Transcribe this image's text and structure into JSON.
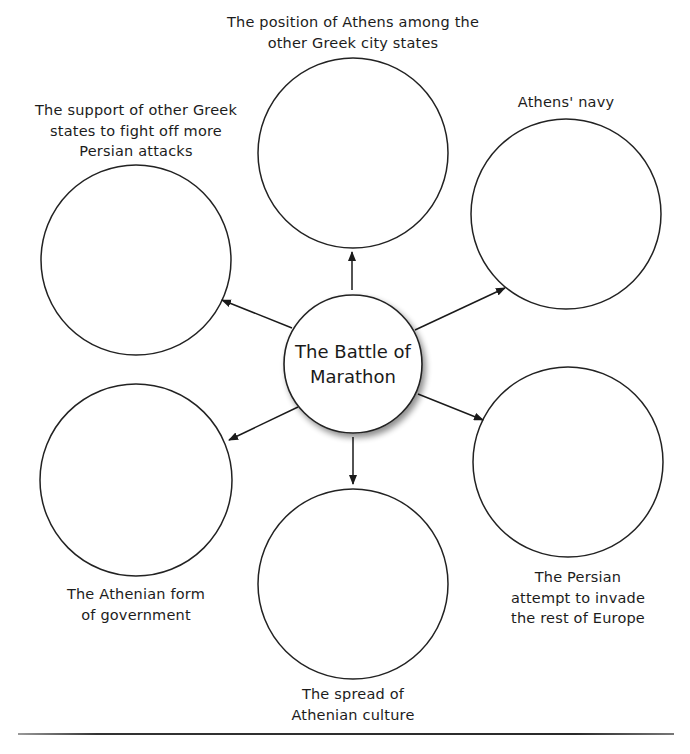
{
  "diagram": {
    "type": "spider-diagram",
    "center": {
      "label_line1": "The Battle of",
      "label_line2": "Marathon"
    },
    "nodes": [
      {
        "id": "top",
        "label_lines": [
          "The position of Athens among the",
          "other Greek city states"
        ]
      },
      {
        "id": "top-left",
        "label_lines": [
          "The support of other Greek",
          "states to fight off more",
          "Persian attacks"
        ]
      },
      {
        "id": "top-right",
        "label_lines": [
          "Athens' navy"
        ]
      },
      {
        "id": "bottom-left",
        "label_lines": [
          "The Athenian form",
          "of government"
        ]
      },
      {
        "id": "bottom-right",
        "label_lines": [
          "The Persian",
          "attempt to invade",
          "the rest of Europe"
        ]
      },
      {
        "id": "bottom",
        "label_lines": [
          "The spread of",
          "Athenian culture"
        ]
      }
    ],
    "colors": {
      "stroke": "#222222",
      "background": "#ffffff",
      "text": "#1c1c1c"
    }
  }
}
